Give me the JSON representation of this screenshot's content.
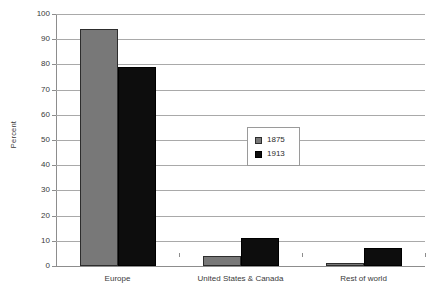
{
  "chart_data": {
    "type": "bar",
    "title": "",
    "subtitle": "",
    "xlabel": "",
    "ylabel": "Percent",
    "ylim": [
      0,
      100
    ],
    "ytick_step": 10,
    "yticks": [
      0,
      10,
      20,
      30,
      40,
      50,
      60,
      70,
      80,
      90,
      100
    ],
    "grid": true,
    "legend_position": "center",
    "categories": [
      "Europe",
      "United States & Canada",
      "Rest of world"
    ],
    "series": [
      {
        "name": "1875",
        "color": "#787878",
        "values": [
          94,
          4,
          1
        ]
      },
      {
        "name": "1913",
        "color": "#0d0d0d",
        "values": [
          79,
          11,
          7
        ]
      }
    ]
  },
  "legend": {
    "items": [
      {
        "label": "1875"
      },
      {
        "label": "1913"
      }
    ]
  },
  "caption": {
    "text": ""
  }
}
